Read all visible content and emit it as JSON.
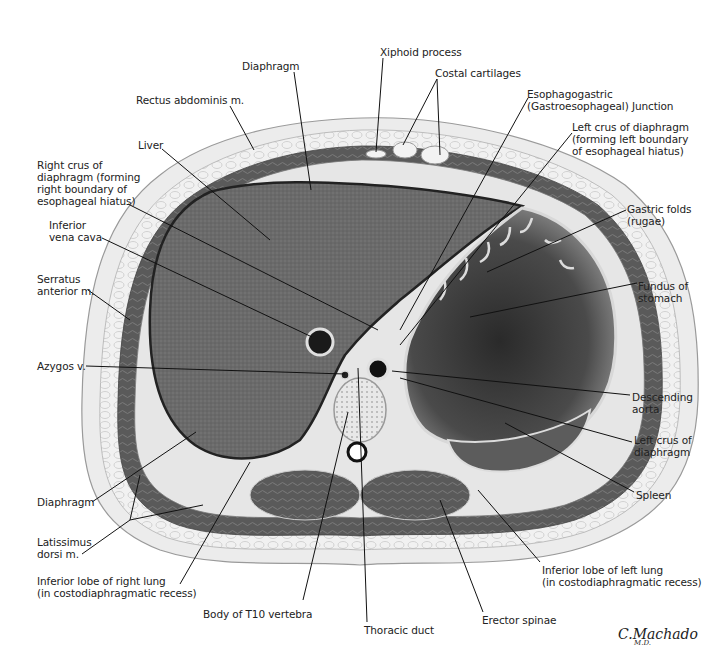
{
  "figure": {
    "signature": "C.Machado",
    "signature_suffix": "M.D.",
    "colors": {
      "background": "#ffffff",
      "skin": "#e9e9e9",
      "fat": "#f4f4f4",
      "muscle": "#5f5f5f",
      "liver": "#6b6b6b",
      "stomach": "#3e3e3e",
      "leader_line": "#111111",
      "text": "#222222"
    }
  },
  "labels": [
    {
      "id": "xiphoid-process",
      "text": "Xiphoid process",
      "x": 380,
      "y": 46,
      "line": [
        [
          383,
          58
        ],
        [
          376,
          152
        ]
      ]
    },
    {
      "id": "diaphragm-top",
      "text": "Diaphragm",
      "x": 242,
      "y": 60,
      "line": [
        [
          294,
          72
        ],
        [
          311,
          190
        ]
      ]
    },
    {
      "id": "costal-cartilages",
      "text": "Costal cartilages",
      "x": 435,
      "y": 67,
      "line": [
        [
          437,
          79
        ],
        [
          403,
          145
        ]
      ],
      "line2": [
        [
          437,
          79
        ],
        [
          440,
          155
        ]
      ]
    },
    {
      "id": "esophagogastric-junction",
      "text": "Esophagogastric\n(Gastroesophageal) Junction",
      "x": 527,
      "y": 88,
      "line": [
        [
          528,
          98
        ],
        [
          400,
          330
        ]
      ]
    },
    {
      "id": "rectus-abdominis",
      "text": "Rectus abdominis m.",
      "x": 136,
      "y": 94,
      "line": [
        [
          230,
          106
        ],
        [
          254,
          150
        ]
      ]
    },
    {
      "id": "left-crus-upper",
      "text": "Left crus of diaphragm\n(forming left boundary\nof esophageal hiatus)",
      "x": 572,
      "y": 121,
      "line": [
        [
          572,
          133
        ],
        [
          400,
          345
        ]
      ]
    },
    {
      "id": "liver",
      "text": "Liver",
      "x": 138,
      "y": 139,
      "line": [
        [
          162,
          149
        ],
        [
          270,
          240
        ]
      ]
    },
    {
      "id": "right-crus",
      "text": "Right crus of\ndiaphragm (forming\nright boundary of\nesophageal hiatus)",
      "x": 37,
      "y": 159,
      "line": [
        [
          128,
          204
        ],
        [
          378,
          330
        ]
      ]
    },
    {
      "id": "gastric-folds",
      "text": "Gastric folds\n(rugae)",
      "x": 627,
      "y": 203,
      "line": [
        [
          626,
          210
        ],
        [
          487,
          272
        ]
      ]
    },
    {
      "id": "inferior-vena-cava",
      "text": "Inferior\nvena cava",
      "x": 49,
      "y": 219,
      "line": [
        [
          102,
          238
        ],
        [
          312,
          337
        ]
      ]
    },
    {
      "id": "serratus-anterior",
      "text": "Serratus\nanterior m.",
      "x": 37,
      "y": 273,
      "line": [
        [
          88,
          290
        ],
        [
          130,
          320
        ]
      ]
    },
    {
      "id": "fundus-of-stomach",
      "text": "Fundus of\nstomach",
      "x": 638,
      "y": 280,
      "line": [
        [
          637,
          283
        ],
        [
          470,
          317
        ]
      ]
    },
    {
      "id": "azygos-vein",
      "text": "Azygos v.",
      "x": 37,
      "y": 360,
      "line": [
        [
          86,
          366
        ],
        [
          345,
          374
        ]
      ]
    },
    {
      "id": "descending-aorta",
      "text": "Descending\naorta",
      "x": 632,
      "y": 391,
      "line": [
        [
          630,
          395
        ],
        [
          392,
          371
        ]
      ]
    },
    {
      "id": "left-crus-lower",
      "text": "Left crus of\ndiaphragm",
      "x": 634,
      "y": 434,
      "line": [
        [
          632,
          442
        ],
        [
          400,
          378
        ]
      ]
    },
    {
      "id": "diaphragm-bottom",
      "text": "Diaphragm",
      "x": 37,
      "y": 496,
      "line": [
        [
          92,
          502
        ],
        [
          196,
          432
        ]
      ]
    },
    {
      "id": "spleen",
      "text": "Spleen",
      "x": 636,
      "y": 489,
      "line": [
        [
          634,
          492
        ],
        [
          505,
          423
        ]
      ]
    },
    {
      "id": "latissimus-dorsi",
      "text": "Latissimus\ndorsi m.",
      "x": 37,
      "y": 536,
      "line": [
        [
          82,
          554
        ],
        [
          130,
          520
        ]
      ],
      "line2": [
        [
          130,
          520
        ],
        [
          140,
          475
        ]
      ],
      "line3": [
        [
          130,
          520
        ],
        [
          203,
          505
        ]
      ]
    },
    {
      "id": "inferior-lobe-right-lung",
      "text": "Inferior lobe of right lung\n(in costodiaphragmatic recess)",
      "x": 37,
      "y": 575,
      "line": [
        [
          180,
          584
        ],
        [
          250,
          462
        ]
      ]
    },
    {
      "id": "inferior-lobe-left-lung",
      "text": "Inferior lobe of left lung\n(in costodiaphragmatic recess)",
      "x": 542,
      "y": 564,
      "line": [
        [
          540,
          562
        ],
        [
          478,
          490
        ]
      ]
    },
    {
      "id": "body-of-t10-vertebra",
      "text": "Body of T10 vertebra",
      "x": 203,
      "y": 608,
      "line": [
        [
          303,
          600
        ],
        [
          348,
          412
        ]
      ]
    },
    {
      "id": "erector-spinae",
      "text": "Erector spinae",
      "x": 482,
      "y": 614,
      "line": [
        [
          483,
          612
        ],
        [
          440,
          500
        ]
      ]
    },
    {
      "id": "thoracic-duct",
      "text": "Thoracic duct",
      "x": 364,
      "y": 624,
      "line": [
        [
          367,
          622
        ],
        [
          358,
          368
        ]
      ]
    }
  ]
}
